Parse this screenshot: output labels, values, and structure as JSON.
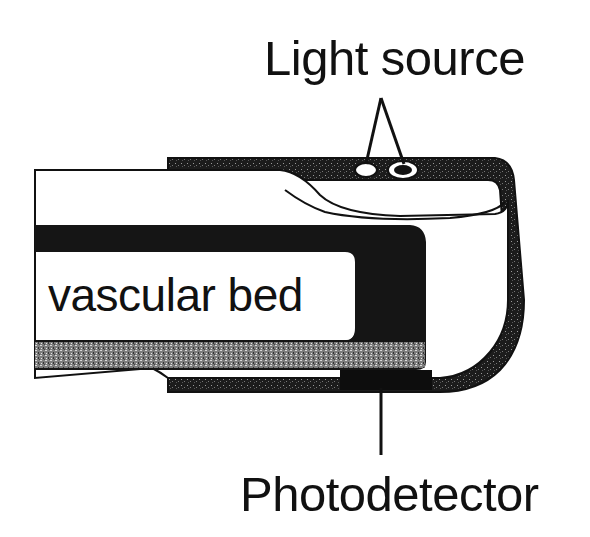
{
  "diagram": {
    "type": "pulse-oximeter-finger-probe-schematic",
    "labels": {
      "light_source": "Light source",
      "vascular_bed": "vascular bed",
      "photodetector": "Photodetector"
    },
    "components": [
      {
        "id": "light-source",
        "label": "Light source",
        "count": 2,
        "position": "top of probe, above fingernail"
      },
      {
        "id": "vascular-bed",
        "label": "vascular bed",
        "position": "inside finger"
      },
      {
        "id": "photodetector",
        "label": "Photodetector",
        "position": "bottom of probe, below finger pad"
      }
    ],
    "colors": {
      "ink": "#111111",
      "probe_fill": "#1a1a1a",
      "tissue_gray": "#8a8a8a",
      "background": "#ffffff"
    }
  }
}
